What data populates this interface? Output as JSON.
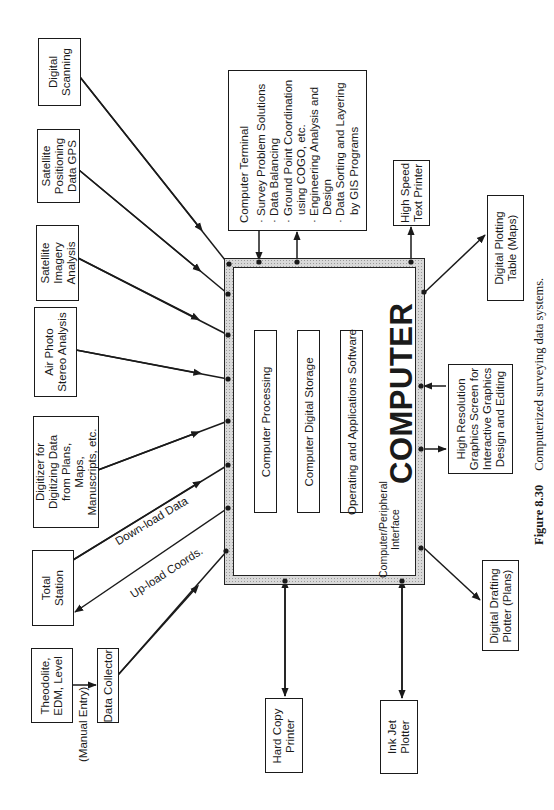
{
  "figure": {
    "number": "Figure 8.30",
    "caption": "Computerized surveying data systems."
  },
  "computer": {
    "title": "COMPUTER",
    "interface_label_line1": "Computer/Peripheral",
    "interface_label_line2": "Interface",
    "inner_boxes": [
      {
        "label": "Computer Processing"
      },
      {
        "label": "Computer Digital Storage"
      },
      {
        "label": "Operating and Applications Software"
      }
    ]
  },
  "terminal": {
    "title": "Computer Terminal",
    "items": [
      [
        "Survey Problem Solutions"
      ],
      [
        "Data Balancing"
      ],
      [
        "Ground Point Coordination",
        "using COGO, etc."
      ],
      [
        "Engineering Analysis and",
        "Design"
      ],
      [
        "Data Sorting and Layering",
        "by GIS Programs"
      ]
    ],
    "bullet": "·"
  },
  "inputs": [
    {
      "id": "digital-scanning",
      "lines": [
        "Digital",
        "Scanning"
      ]
    },
    {
      "id": "satellite-positioning",
      "lines": [
        "Satellite",
        "Positioning",
        "Data GPS"
      ]
    },
    {
      "id": "satellite-imagery",
      "lines": [
        "Satellite",
        "Imagery",
        "Analysis"
      ]
    },
    {
      "id": "air-photo",
      "lines": [
        "Air Photo",
        "Stereo Analysis"
      ]
    },
    {
      "id": "digitizer",
      "lines": [
        "Digitizer for",
        "Digitizing Data",
        "from Plans,",
        "Maps,",
        "Manuscripts, etc."
      ]
    },
    {
      "id": "total-station",
      "lines": [
        "Total",
        "Station"
      ]
    },
    {
      "id": "theodolite",
      "lines": [
        "Theodolite,",
        "EDM, Level"
      ]
    },
    {
      "id": "data-collector",
      "lines": [
        "Data Collector"
      ]
    }
  ],
  "outputs": [
    {
      "id": "high-speed-printer",
      "lines": [
        "High Speed",
        "Text Printer"
      ]
    },
    {
      "id": "digital-plotting-table",
      "lines": [
        "Digital Plotting",
        "Table (Maps)"
      ]
    },
    {
      "id": "hi-res-graphics",
      "lines": [
        "High Resolution",
        "Graphics Screen for",
        "Interactive Graphics",
        "Design and Editing"
      ]
    },
    {
      "id": "digital-drafting-plotter",
      "lines": [
        "Digital Drafting",
        "Plotter (Plans)"
      ]
    },
    {
      "id": "hard-copy-printer",
      "lines": [
        "Hard Copy",
        "Printer"
      ]
    },
    {
      "id": "ink-jet-plotter",
      "lines": [
        "Ink Jet",
        "Plotter"
      ]
    }
  ],
  "edge_labels": {
    "download": "Down-load Data",
    "upload": "Up-load Coords.",
    "manual": "(Manual Entry)"
  },
  "colors": {
    "ink": "#1a1a1a",
    "hatch": "#d9d9d9",
    "background": "#ffffff"
  }
}
